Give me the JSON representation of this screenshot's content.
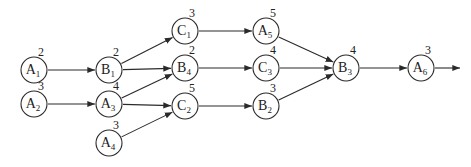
{
  "diagram": {
    "type": "activity-network",
    "nodes": [
      {
        "id": "A1",
        "letter": "A",
        "sub": "1",
        "duration": "2",
        "x": 34,
        "y": 70
      },
      {
        "id": "A2",
        "letter": "A",
        "sub": "2",
        "duration": "3",
        "x": 34,
        "y": 104
      },
      {
        "id": "B1",
        "letter": "B",
        "sub": "1",
        "duration": "2",
        "x": 109,
        "y": 70
      },
      {
        "id": "A3",
        "letter": "A",
        "sub": "3",
        "duration": "4",
        "x": 109,
        "y": 104
      },
      {
        "id": "A4",
        "letter": "A",
        "sub": "4",
        "duration": "3",
        "x": 109,
        "y": 143
      },
      {
        "id": "C1",
        "letter": "C",
        "sub": "1",
        "duration": "3",
        "x": 185,
        "y": 31
      },
      {
        "id": "B4",
        "letter": "B",
        "sub": "4",
        "duration": "2",
        "x": 185,
        "y": 68
      },
      {
        "id": "C2",
        "letter": "C",
        "sub": "2",
        "duration": "5",
        "x": 185,
        "y": 106
      },
      {
        "id": "A5",
        "letter": "A",
        "sub": "5",
        "duration": "5",
        "x": 266,
        "y": 31
      },
      {
        "id": "C3",
        "letter": "C",
        "sub": "3",
        "duration": "4",
        "x": 266,
        "y": 68
      },
      {
        "id": "B2",
        "letter": "B",
        "sub": "2",
        "duration": "3",
        "x": 266,
        "y": 106
      },
      {
        "id": "B3",
        "letter": "B",
        "sub": "3",
        "duration": "4",
        "x": 346,
        "y": 68
      },
      {
        "id": "A6",
        "letter": "A",
        "sub": "6",
        "duration": "3",
        "x": 421,
        "y": 68
      }
    ],
    "edges": [
      {
        "from": "A1",
        "to": "B1"
      },
      {
        "from": "A2",
        "to": "A3"
      },
      {
        "from": "B1",
        "to": "C1"
      },
      {
        "from": "B1",
        "to": "B4"
      },
      {
        "from": "A3",
        "to": "B4"
      },
      {
        "from": "A3",
        "to": "C2"
      },
      {
        "from": "A4",
        "to": "C2"
      },
      {
        "from": "C1",
        "to": "A5"
      },
      {
        "from": "B4",
        "to": "C3"
      },
      {
        "from": "C2",
        "to": "B2"
      },
      {
        "from": "A5",
        "to": "B3"
      },
      {
        "from": "C3",
        "to": "B3"
      },
      {
        "from": "B2",
        "to": "B3"
      },
      {
        "from": "B3",
        "to": "A6"
      }
    ],
    "exit_arrow": {
      "from": "A6",
      "to_x": 460,
      "to_y": 68
    },
    "node_radius": 13,
    "colors": {
      "stroke": "#2a2a2a",
      "background": "#ffffff",
      "text": "#222222"
    }
  }
}
